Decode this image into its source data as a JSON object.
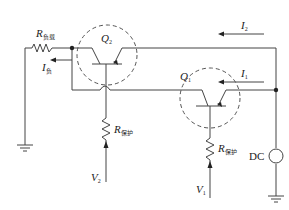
{
  "diagram": {
    "type": "circuit-schematic",
    "labels": {
      "r_load": {
        "main": "R",
        "sub": "负载"
      },
      "i_load": {
        "main": "I",
        "sub": "负"
      },
      "q2": {
        "main": "Q",
        "sub": "2"
      },
      "q1": {
        "main": "Q",
        "sub": "1"
      },
      "i2": {
        "main": "I",
        "sub": "2"
      },
      "i1": {
        "main": "I",
        "sub": "1"
      },
      "r_prot_2": {
        "main": "R",
        "sub": "保护"
      },
      "r_prot_1": {
        "main": "R",
        "sub": "保护"
      },
      "v2": {
        "main": "V",
        "sub": "2"
      },
      "v1": {
        "main": "V",
        "sub": "1"
      },
      "dc": "DC"
    },
    "components": [
      "R负载",
      "Q2 (PNP transistor)",
      "Q1 (PNP transistor)",
      "R保护 (Q2 base)",
      "R保护 (Q1 base)",
      "DC source",
      "ground x2"
    ],
    "colors": {
      "wire": "#444444",
      "dashed": "#555555"
    }
  }
}
